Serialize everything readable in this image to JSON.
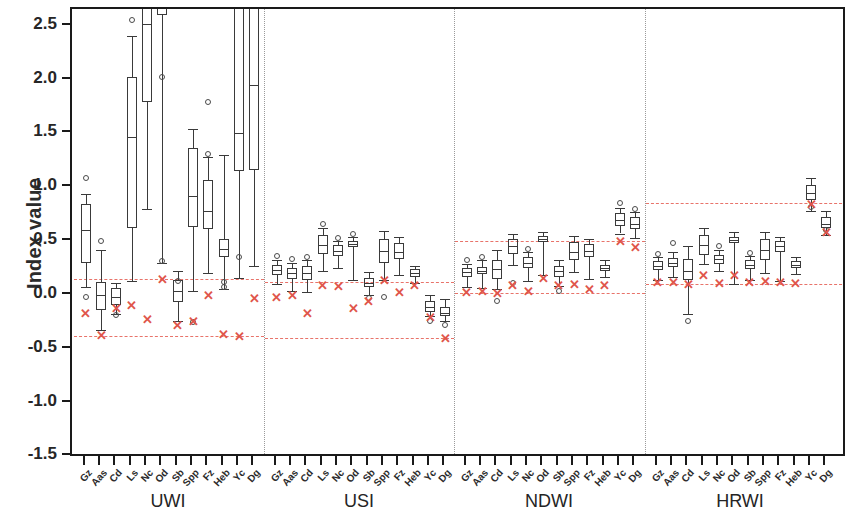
{
  "chart_data": {
    "type": "box",
    "title": "",
    "xlabel": "",
    "ylabel": "Index value",
    "ylim": [
      -1.5,
      2.6
    ],
    "yticks": [
      2.5,
      2.0,
      1.5,
      1.0,
      0.5,
      0.0,
      -0.5,
      -1.0,
      -1.5
    ],
    "ytick_labels": [
      "2.5",
      "2.0",
      "1.5",
      "1.0",
      "0.5",
      "0.0",
      "-0.5",
      "-1.0",
      "-1.5"
    ],
    "grid": false,
    "legend": "none",
    "groups": [
      "UWI",
      "USI",
      "NDWI",
      "HRWI"
    ],
    "categories": [
      "Gz",
      "Aas",
      "Cd",
      "Ls",
      "Nc",
      "Od",
      "Sb",
      "Spp",
      "Fz",
      "Heb",
      "Yc",
      "Dg"
    ],
    "reference_lines": {
      "UWI": [
        0.15,
        -0.38
      ],
      "USI": [
        0.12,
        -0.4
      ],
      "NDWI": [
        0.5,
        0.02
      ],
      "HRWI": [
        0.85,
        0.1
      ]
    },
    "series": [
      {
        "group": "UWI",
        "boxes": [
          {
            "cat": "Gz",
            "whisker_low": 0.07,
            "q1": 0.3,
            "median": 0.6,
            "q3": 0.84,
            "whisker_high": 0.94,
            "outliers": [
              1.09,
              -0.02
            ],
            "xmark": -0.17
          },
          {
            "cat": "Aas",
            "whisker_low": -0.33,
            "q1": -0.14,
            "median": 0.0,
            "q3": 0.12,
            "whisker_high": 0.42,
            "outliers": [
              0.5
            ],
            "xmark": -0.37
          },
          {
            "cat": "Cd",
            "whisker_low": -0.18,
            "q1": -0.09,
            "median": -0.02,
            "q3": 0.06,
            "whisker_high": 0.11,
            "outliers": [
              -0.19
            ],
            "xmark": -0.12
          },
          {
            "cat": "Ls",
            "whisker_low": 0.13,
            "q1": 0.62,
            "median": 1.47,
            "q3": 2.02,
            "whisker_high": 2.4,
            "outliers": [
              2.55
            ],
            "xmark": -0.09
          },
          {
            "cat": "Nc",
            "whisker_low": 0.8,
            "q1": 1.79,
            "median": 2.52,
            "q3": 2.8,
            "whisker_high": 2.95,
            "outliers": [],
            "xmark": -0.22
          },
          {
            "cat": "Od",
            "whisker_low": 0.3,
            "q1": 2.6,
            "median": 2.8,
            "q3": 3.0,
            "whisker_high": 3.1,
            "outliers": [
              2.02,
              0.31
            ],
            "xmark": 0.15
          },
          {
            "cat": "Sb",
            "whisker_low": -0.24,
            "q1": -0.07,
            "median": 0.04,
            "q3": 0.14,
            "whisker_high": 0.22,
            "outliers": [
              0.13
            ],
            "xmark": -0.28
          },
          {
            "cat": "Spp",
            "whisker_low": 0.04,
            "q1": 0.63,
            "median": 0.92,
            "q3": 1.36,
            "whisker_high": 1.54,
            "outliers": [
              -0.25
            ],
            "xmark": -0.24
          },
          {
            "cat": "Fz",
            "whisker_low": 0.2,
            "q1": 0.61,
            "median": 0.78,
            "q3": 1.07,
            "whisker_high": 1.28,
            "outliers": [
              1.31,
              1.79
            ],
            "xmark": 0.0
          },
          {
            "cat": "Heb",
            "whisker_low": 0.05,
            "q1": 0.35,
            "median": 0.43,
            "q3": 0.52,
            "whisker_high": 1.3,
            "outliers": [
              0.12,
              0.07
            ],
            "xmark": -0.36
          },
          {
            "cat": "Yc",
            "whisker_low": 0.16,
            "q1": 1.15,
            "median": 1.5,
            "q3": 3.0,
            "whisker_high": 3.1,
            "outliers": [
              0.35
            ],
            "xmark": -0.38
          },
          {
            "cat": "Dg",
            "whisker_low": 0.27,
            "q1": 1.16,
            "median": 1.95,
            "q3": 3.0,
            "whisker_high": 3.1,
            "outliers": [],
            "xmark": -0.03
          }
        ]
      },
      {
        "group": "USI",
        "boxes": [
          {
            "cat": "Gz",
            "whisker_low": 0.1,
            "q1": 0.18,
            "median": 0.23,
            "q3": 0.28,
            "whisker_high": 0.32,
            "outliers": [
              0.36
            ],
            "xmark": -0.02
          },
          {
            "cat": "Aas",
            "whisker_low": 0.04,
            "q1": 0.15,
            "median": 0.2,
            "q3": 0.25,
            "whisker_high": 0.3,
            "outliers": [
              0.33
            ],
            "xmark": 0.0
          },
          {
            "cat": "Cd",
            "whisker_low": 0.03,
            "q1": 0.14,
            "median": 0.2,
            "q3": 0.27,
            "whisker_high": 0.32,
            "outliers": [
              0.35
            ],
            "xmark": -0.17
          },
          {
            "cat": "Ls",
            "whisker_low": 0.22,
            "q1": 0.38,
            "median": 0.46,
            "q3": 0.56,
            "whisker_high": 0.62,
            "outliers": [
              0.66
            ],
            "xmark": 0.09
          },
          {
            "cat": "Nc",
            "whisker_low": 0.25,
            "q1": 0.36,
            "median": 0.41,
            "q3": 0.46,
            "whisker_high": 0.5,
            "outliers": [
              0.53
            ],
            "xmark": 0.08
          },
          {
            "cat": "Od",
            "whisker_low": 0.14,
            "q1": 0.44,
            "median": 0.47,
            "q3": 0.5,
            "whisker_high": 0.54,
            "outliers": [
              0.57
            ],
            "xmark": -0.12
          },
          {
            "cat": "Sb",
            "whisker_low": 0.0,
            "q1": 0.07,
            "median": 0.11,
            "q3": 0.16,
            "whisker_high": 0.21,
            "outliers": [
              -0.03
            ],
            "xmark": -0.06
          },
          {
            "cat": "Spp",
            "whisker_low": 0.14,
            "q1": 0.3,
            "median": 0.41,
            "q3": 0.52,
            "whisker_high": 0.59,
            "outliers": [
              -0.02
            ],
            "xmark": 0.14
          },
          {
            "cat": "Fz",
            "whisker_low": 0.18,
            "q1": 0.33,
            "median": 0.4,
            "q3": 0.48,
            "whisker_high": 0.54,
            "outliers": [],
            "xmark": 0.03
          },
          {
            "cat": "Heb",
            "whisker_low": 0.11,
            "q1": 0.17,
            "median": 0.2,
            "q3": 0.24,
            "whisker_high": 0.27,
            "outliers": [],
            "xmark": 0.09
          },
          {
            "cat": "Yc",
            "whisker_low": -0.2,
            "q1": -0.16,
            "median": -0.11,
            "q3": -0.06,
            "whisker_high": 0.0,
            "outliers": [
              -0.24
            ],
            "xmark": -0.21
          },
          {
            "cat": "Dg",
            "whisker_low": -0.24,
            "q1": -0.2,
            "median": -0.17,
            "q3": -0.11,
            "whisker_high": -0.04,
            "outliers": [
              -0.28
            ],
            "xmark": -0.4
          }
        ]
      },
      {
        "group": "NDWI",
        "boxes": [
          {
            "cat": "Gz",
            "whisker_low": 0.07,
            "q1": 0.17,
            "median": 0.21,
            "q3": 0.25,
            "whisker_high": 0.29,
            "outliers": [
              0.32
            ],
            "xmark": 0.03
          },
          {
            "cat": "Aas",
            "whisker_low": 0.06,
            "q1": 0.19,
            "median": 0.22,
            "q3": 0.26,
            "whisker_high": 0.32,
            "outliers": [
              0.35
            ],
            "xmark": 0.04
          },
          {
            "cat": "Cd",
            "whisker_low": 0.05,
            "q1": 0.15,
            "median": 0.24,
            "q3": 0.32,
            "whisker_high": 0.42,
            "outliers": [
              -0.06
            ],
            "xmark": 0.02
          },
          {
            "cat": "Ls",
            "whisker_low": 0.28,
            "q1": 0.38,
            "median": 0.45,
            "q3": 0.52,
            "whisker_high": 0.57,
            "outliers": [
              0.11
            ],
            "xmark": 0.09
          },
          {
            "cat": "Nc",
            "whisker_low": 0.13,
            "q1": 0.25,
            "median": 0.3,
            "q3": 0.35,
            "whisker_high": 0.4,
            "outliers": [
              0.43
            ],
            "xmark": 0.04
          },
          {
            "cat": "Od",
            "whisker_low": 0.18,
            "q1": 0.49,
            "median": 0.52,
            "q3": 0.55,
            "whisker_high": 0.58,
            "outliers": [],
            "xmark": 0.16
          },
          {
            "cat": "Sb",
            "whisker_low": 0.08,
            "q1": 0.17,
            "median": 0.22,
            "q3": 0.27,
            "whisker_high": 0.32,
            "outliers": [
              0.04
            ],
            "xmark": 0.09
          },
          {
            "cat": "Spp",
            "whisker_low": 0.21,
            "q1": 0.32,
            "median": 0.4,
            "q3": 0.49,
            "whisker_high": 0.55,
            "outliers": [],
            "xmark": 0.1
          },
          {
            "cat": "Fz",
            "whisker_low": 0.15,
            "q1": 0.35,
            "median": 0.41,
            "q3": 0.47,
            "whisker_high": 0.52,
            "outliers": [],
            "xmark": 0.05
          },
          {
            "cat": "Heb",
            "whisker_low": 0.17,
            "q1": 0.22,
            "median": 0.25,
            "q3": 0.28,
            "whisker_high": 0.32,
            "outliers": [],
            "xmark": 0.09
          },
          {
            "cat": "Yc",
            "whisker_low": 0.57,
            "q1": 0.64,
            "median": 0.7,
            "q3": 0.76,
            "whisker_high": 0.81,
            "outliers": [
              0.85
            ],
            "xmark": 0.5
          },
          {
            "cat": "Dg",
            "whisker_low": 0.53,
            "q1": 0.61,
            "median": 0.66,
            "q3": 0.72,
            "whisker_high": 0.77,
            "outliers": [
              0.8
            ],
            "xmark": 0.44
          }
        ]
      },
      {
        "group": "HRWI",
        "boxes": [
          {
            "cat": "Gz",
            "whisker_low": 0.14,
            "q1": 0.23,
            "median": 0.27,
            "q3": 0.31,
            "whisker_high": 0.35,
            "outliers": [
              0.38
            ],
            "xmark": 0.12
          },
          {
            "cat": "Aas",
            "whisker_low": 0.17,
            "q1": 0.26,
            "median": 0.3,
            "q3": 0.34,
            "whisker_high": 0.4,
            "outliers": [
              0.48
            ],
            "xmark": 0.12
          },
          {
            "cat": "Cd",
            "whisker_low": -0.18,
            "q1": 0.14,
            "median": 0.22,
            "q3": 0.33,
            "whisker_high": 0.45,
            "outliers": [
              -0.24
            ],
            "xmark": 0.1
          },
          {
            "cat": "Ls",
            "whisker_low": 0.29,
            "q1": 0.37,
            "median": 0.46,
            "q3": 0.56,
            "whisker_high": 0.62,
            "outliers": [],
            "xmark": 0.18
          },
          {
            "cat": "Nc",
            "whisker_low": 0.22,
            "q1": 0.29,
            "median": 0.33,
            "q3": 0.37,
            "whisker_high": 0.42,
            "outliers": [
              0.45
            ],
            "xmark": 0.11
          },
          {
            "cat": "Od",
            "whisker_low": 0.1,
            "q1": 0.48,
            "median": 0.51,
            "q3": 0.54,
            "whisker_high": 0.58,
            "outliers": [],
            "xmark": 0.18
          },
          {
            "cat": "Sb",
            "whisker_low": 0.14,
            "q1": 0.24,
            "median": 0.28,
            "q3": 0.32,
            "whisker_high": 0.36,
            "outliers": [
              0.39
            ],
            "xmark": 0.12
          },
          {
            "cat": "Spp",
            "whisker_low": 0.2,
            "q1": 0.32,
            "median": 0.42,
            "q3": 0.52,
            "whisker_high": 0.58,
            "outliers": [],
            "xmark": 0.13
          },
          {
            "cat": "Fz",
            "whisker_low": 0.13,
            "q1": 0.4,
            "median": 0.45,
            "q3": 0.5,
            "whisker_high": 0.54,
            "outliers": [],
            "xmark": 0.12
          },
          {
            "cat": "Heb",
            "whisker_low": 0.19,
            "q1": 0.25,
            "median": 0.28,
            "q3": 0.31,
            "whisker_high": 0.35,
            "outliers": [],
            "xmark": 0.11
          },
          {
            "cat": "Yc",
            "whisker_low": 0.78,
            "q1": 0.88,
            "median": 0.95,
            "q3": 1.02,
            "whisker_high": 1.09,
            "outliers": [
              0.82
            ],
            "xmark": 0.84
          },
          {
            "cat": "Dg",
            "whisker_low": 0.56,
            "q1": 0.62,
            "median": 0.66,
            "q3": 0.72,
            "whisker_high": 0.78,
            "outliers": [
              0.6
            ],
            "xmark": 0.58
          }
        ]
      }
    ],
    "colors": {
      "box_stroke": "#3a3a3a",
      "reference_line": "#e8736a",
      "xmark": "#e0554a",
      "axis": "#1a1a1a",
      "separator": "#9a9a9a"
    }
  }
}
